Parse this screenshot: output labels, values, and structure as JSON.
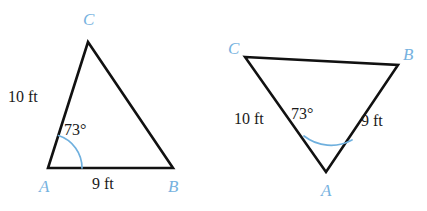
{
  "figure": {
    "background_color": "#ffffff",
    "stroke_color": "#111111",
    "vertex_label_color": "#76b2e0",
    "arc_color": "#6fb0de",
    "text_color": "#1a1a1a"
  },
  "triangles": [
    {
      "name": "left-triangle",
      "orientation": "apex-up",
      "vertices": [
        {
          "id": "C",
          "label": "C",
          "x": 88,
          "y": 42
        },
        {
          "id": "A",
          "label": "A",
          "x": 48,
          "y": 168
        },
        {
          "id": "B",
          "label": "B",
          "x": 173,
          "y": 168
        }
      ],
      "vertex_labels": [
        {
          "id": "C",
          "label": "C",
          "left": 83,
          "top": 11
        },
        {
          "id": "A",
          "label": "A",
          "left": 39,
          "top": 178
        },
        {
          "id": "B",
          "label": "B",
          "left": 168,
          "top": 178
        }
      ],
      "side_labels": [
        {
          "id": "side-CA",
          "label": "10 ft",
          "left": 8,
          "top": 89
        },
        {
          "id": "side-AB",
          "label": "9 ft",
          "left": 92,
          "top": 176
        }
      ],
      "angle": {
        "id": "angle-A",
        "label": "73°",
        "value": 73,
        "unit": "degrees",
        "at_vertex": "A",
        "label_left": 64,
        "label_top": 122
      }
    },
    {
      "name": "right-triangle",
      "orientation": "apex-down",
      "vertices": [
        {
          "id": "C",
          "label": "C",
          "x": 245,
          "y": 57
        },
        {
          "id": "B",
          "label": "B",
          "x": 398,
          "y": 65
        },
        {
          "id": "A",
          "label": "A",
          "x": 326,
          "y": 172
        }
      ],
      "vertex_labels": [
        {
          "id": "C",
          "label": "C",
          "left": 228,
          "top": 40
        },
        {
          "id": "B",
          "label": "B",
          "left": 403,
          "top": 46
        },
        {
          "id": "A",
          "label": "A",
          "left": 321,
          "top": 182
        }
      ],
      "side_labels": [
        {
          "id": "side-CA",
          "label": "10 ft",
          "left": 234,
          "top": 111
        },
        {
          "id": "side-AB",
          "label": "9 ft",
          "left": 361,
          "top": 113
        }
      ],
      "angle": {
        "id": "angle-A",
        "label": "73°",
        "value": 73,
        "unit": "degrees",
        "at_vertex": "A",
        "label_left": 291,
        "label_top": 106
      }
    }
  ]
}
